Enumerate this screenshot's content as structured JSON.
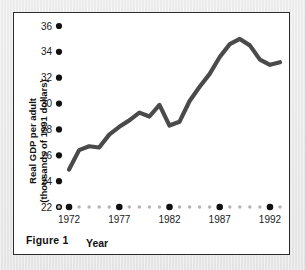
{
  "figure": {
    "caption": "Figure 1"
  },
  "chart_data": {
    "type": "line",
    "title": "",
    "xlabel": "Year",
    "ylabel": "Real GDP per adult (thousands of 1991 dollars)",
    "ylabel_line1": "Real GDP per adult",
    "ylabel_line2": "(thousands of 1991 dollars)",
    "ylim": [
      22,
      36
    ],
    "xlim": [
      1971,
      1993
    ],
    "yticks": [
      22,
      24,
      26,
      28,
      30,
      32,
      34,
      36
    ],
    "ytick_labels": [
      "22",
      "24",
      "26",
      "28",
      "30",
      "32",
      "34",
      "36"
    ],
    "xticks_major": [
      1972,
      1977,
      1982,
      1987,
      1992
    ],
    "xtick_labels": [
      "1972",
      "1977",
      "1982",
      "1987",
      "1992"
    ],
    "xticks_minor": [
      1971,
      1973,
      1974,
      1975,
      1976,
      1978,
      1979,
      1980,
      1981,
      1983,
      1984,
      1985,
      1986,
      1988,
      1989,
      1990,
      1991,
      1993
    ],
    "grid": false,
    "legend": false,
    "line_color": "#4a4a4a",
    "axis_color": "#111111",
    "minor_tick_color": "#b4b4b4",
    "series": [
      {
        "name": "Real GDP per adult",
        "x": [
          1972,
          1973,
          1974,
          1975,
          1976,
          1977,
          1978,
          1979,
          1980,
          1981,
          1982,
          1983,
          1984,
          1985,
          1986,
          1987,
          1988,
          1989,
          1990,
          1991,
          1992,
          1993
        ],
        "values": [
          24.9,
          26.4,
          26.7,
          26.6,
          27.6,
          28.2,
          28.7,
          29.3,
          29.0,
          29.9,
          28.3,
          28.6,
          30.2,
          31.3,
          32.3,
          33.6,
          34.6,
          35.0,
          34.5,
          33.4,
          33.0,
          33.2
        ]
      }
    ]
  }
}
